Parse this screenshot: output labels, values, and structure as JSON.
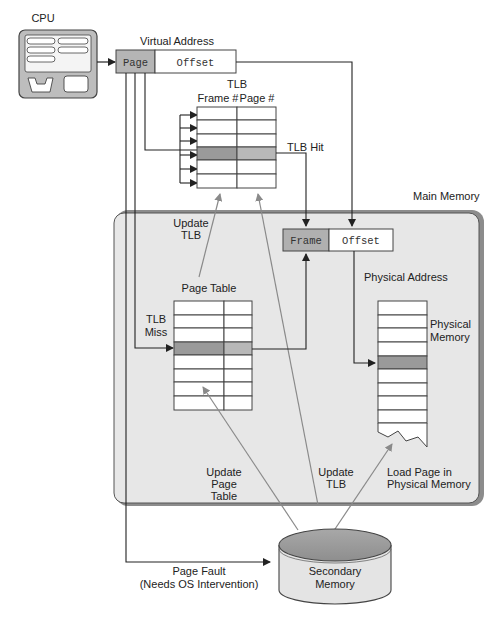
{
  "diagram": {
    "type": "paging-with-tlb",
    "colors": {
      "line": "#222222",
      "grey_arrow": "#8a8a8a",
      "highlight_dark": "#9a9a9a",
      "highlight_light": "#b8b8b8",
      "main_memory_fill": "#e6e6e6",
      "main_memory_border": "#8c8c8c",
      "cpu_fill": "#bdbdbd"
    },
    "cpu": {
      "label": "CPU"
    },
    "virtual_address": {
      "title": "Virtual Address",
      "page": "Page",
      "offset": "Offset"
    },
    "tlb": {
      "title": "TLB",
      "col_frame": "Frame #",
      "col_page": "Page #",
      "rows": 6,
      "hit_row": 3,
      "hit_label": "TLB Hit"
    },
    "main_memory": {
      "title": "Main Memory"
    },
    "physical_address": {
      "title": "Physical Address",
      "frame": "Frame",
      "offset": "Offset"
    },
    "page_table": {
      "title": "Page Table",
      "rows": 8,
      "hit_row": 3,
      "miss_label_1": "TLB",
      "miss_label_2": "Miss"
    },
    "update_tlb_top": {
      "line1": "Update",
      "line2": "TLB"
    },
    "physical_memory": {
      "line1": "Physical",
      "line2": "Memory",
      "rows": 10,
      "hit_row": 4
    },
    "update_page_table": {
      "line1": "Update",
      "line2": "Page",
      "line3": "Table"
    },
    "update_tlb_bottom": {
      "line1": "Update",
      "line2": "TLB"
    },
    "load_page": {
      "line1": "Load Page in",
      "line2": "Physical Memory"
    },
    "page_fault": {
      "line1": "Page Fault",
      "line2": "(Needs OS Intervention)"
    },
    "secondary_memory": {
      "line1": "Secondary",
      "line2": "Memory"
    }
  }
}
